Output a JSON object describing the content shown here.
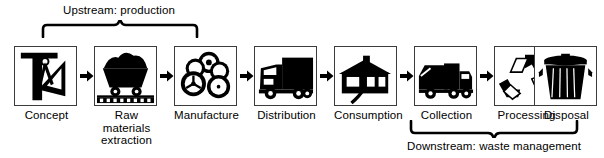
{
  "diagram": {
    "background_color": "#ffffff",
    "ink_color": "#000000",
    "box_border_color": "#3c3c3c"
  },
  "annotations": {
    "upstream": {
      "label": "Upstream: production",
      "bracket_direction": "up",
      "spans_stages": [
        "Concept",
        "Raw materials extraction",
        "Manufacture"
      ]
    },
    "downstream": {
      "label": "Downstream: waste management",
      "bracket_direction": "down",
      "spans_stages": [
        "Collection",
        "Processing",
        "Disposal"
      ]
    }
  },
  "flow": {
    "arrow_glyph": "▶",
    "arrow_count": 7,
    "stages": [
      {
        "label": "Concept",
        "icon": "drafting-tools-icon"
      },
      {
        "label": "Raw\nmaterials\nextraction",
        "label_line1": "Raw",
        "label_line2": "materials",
        "label_line3": "extraction",
        "icon": "mine-cart-icon"
      },
      {
        "label": "Manufacture",
        "icon": "tires-icon"
      },
      {
        "label": "Distribution",
        "icon": "delivery-truck-icon"
      },
      {
        "label": "Consumption",
        "icon": "house-icon"
      },
      {
        "label": "Collection",
        "icon": "garbage-truck-icon"
      },
      {
        "label": "Processing",
        "icon": "recycling-symbol-icon"
      },
      {
        "label": "Disposal",
        "icon": "trash-can-icon"
      }
    ]
  }
}
